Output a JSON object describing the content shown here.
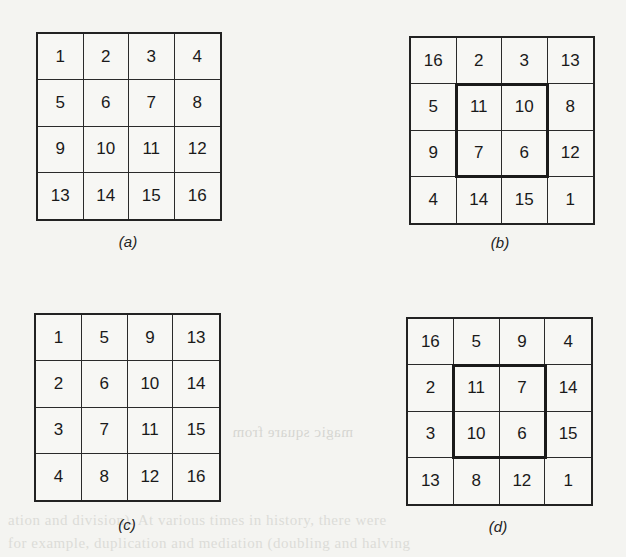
{
  "figures": [
    {
      "id": "a",
      "caption": "(a)",
      "highlight_center": false,
      "cells": [
        [
          1,
          2,
          3,
          4
        ],
        [
          5,
          6,
          7,
          8
        ],
        [
          9,
          10,
          11,
          12
        ],
        [
          13,
          14,
          15,
          16
        ]
      ]
    },
    {
      "id": "b",
      "caption": "(b)",
      "highlight_center": true,
      "cells": [
        [
          16,
          2,
          3,
          13
        ],
        [
          5,
          11,
          10,
          8
        ],
        [
          9,
          7,
          6,
          12
        ],
        [
          4,
          14,
          15,
          1
        ]
      ]
    },
    {
      "id": "c",
      "caption": "(c)",
      "highlight_center": false,
      "cells": [
        [
          1,
          5,
          9,
          13
        ],
        [
          2,
          6,
          10,
          14
        ],
        [
          3,
          7,
          11,
          15
        ],
        [
          4,
          8,
          12,
          16
        ]
      ]
    },
    {
      "id": "d",
      "caption": "(d)",
      "highlight_center": true,
      "cells": [
        [
          16,
          5,
          9,
          4
        ],
        [
          2,
          11,
          7,
          14
        ],
        [
          3,
          10,
          6,
          15
        ],
        [
          13,
          8,
          12,
          1
        ]
      ]
    }
  ],
  "bleed_through_text": [
    "magic square from",
    "ation and division). At various times in history, there were",
    "for example, duplication and mediation (doubling and halving"
  ]
}
